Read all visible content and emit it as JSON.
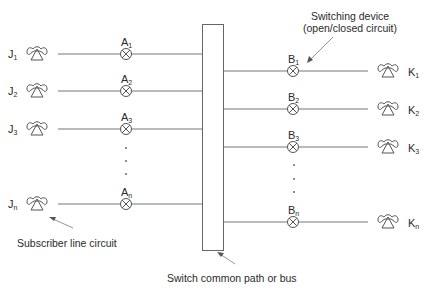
{
  "diagram": {
    "type": "telephone switching schematic",
    "left_subscribers": [
      {
        "label": "J",
        "sub": "1",
        "switch_label": "A",
        "switch_sub": "1",
        "y": 54
      },
      {
        "label": "J",
        "sub": "2",
        "switch_label": "A",
        "switch_sub": "2",
        "y": 91
      },
      {
        "label": "J",
        "sub": "3",
        "switch_label": "A",
        "switch_sub": "3",
        "y": 129
      },
      {
        "label": "J",
        "sub": "n",
        "switch_label": "A",
        "switch_sub": "n",
        "y": 204
      }
    ],
    "right_subscribers": [
      {
        "label": "K",
        "sub": "1",
        "switch_label": "B",
        "switch_sub": "1",
        "y": 71
      },
      {
        "label": "K",
        "sub": "2",
        "switch_label": "B",
        "switch_sub": "2",
        "y": 109
      },
      {
        "label": "K",
        "sub": "3",
        "switch_label": "B",
        "switch_sub": "3",
        "y": 147
      },
      {
        "label": "K",
        "sub": "n",
        "switch_label": "B",
        "switch_sub": "n",
        "y": 222
      }
    ],
    "annotations": {
      "switching_device_line1": "Switching device",
      "switching_device_line2": "(open/closed circuit)",
      "subscriber_line": "Subscriber line circuit",
      "bus": "Switch common path or bus"
    },
    "icons": {
      "subscriber": "telephone-icon",
      "switch": "crossed-circle-switch-icon"
    },
    "colors": {
      "line": "#6b6b6b",
      "text": "#2a2a2a",
      "background": "#ffffff"
    }
  }
}
